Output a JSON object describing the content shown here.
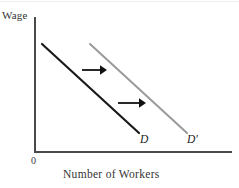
{
  "figure": {
    "background_color": "#ffffff",
    "top_rule_color": "#ededf0"
  },
  "axes": {
    "y_title": "Wage",
    "x_title": "Number of Workers",
    "origin_label": "0",
    "axis_color": "#4a4a4a",
    "y_axis": {
      "x": 35,
      "y_top": 17,
      "y_bottom": 152
    },
    "x_axis": {
      "y": 152,
      "x_left": 35,
      "x_right": 232
    }
  },
  "curves": [
    {
      "name": "D",
      "label": "D",
      "color": "#1a1a1a",
      "width": 2.2,
      "x1": 42,
      "y1": 44,
      "x2": 139,
      "y2": 133,
      "label_x": 140,
      "label_y": 133
    },
    {
      "name": "D-prime",
      "label": "D′",
      "color": "#9a9a9a",
      "width": 2.0,
      "x1": 90,
      "y1": 44,
      "x2": 187,
      "y2": 133,
      "label_x": 187,
      "label_y": 133
    }
  ],
  "arrows": [
    {
      "name": "shift-arrow-upper",
      "color": "#111111",
      "x1": 82,
      "y": 70,
      "x2": 107
    },
    {
      "name": "shift-arrow-lower",
      "color": "#111111",
      "x1": 118,
      "y": 103,
      "x2": 146
    }
  ],
  "chart_data": {
    "type": "line",
    "title": "",
    "xlabel": "Number of Workers",
    "ylabel": "Wage",
    "grid": false,
    "legend": "inline-curve-labels",
    "annotations": [
      "0",
      "D",
      "D′"
    ],
    "series": [
      {
        "name": "D",
        "label": "D",
        "color": "#1a1a1a",
        "points": [
          [
            42,
            44
          ],
          [
            139,
            133
          ]
        ]
      },
      {
        "name": "D′",
        "label": "D′",
        "color": "#9a9a9a",
        "points": [
          [
            90,
            44
          ],
          [
            187,
            133
          ]
        ]
      }
    ],
    "axis_ranges": {
      "x": [
        35,
        232
      ],
      "y": [
        17,
        152
      ]
    }
  }
}
